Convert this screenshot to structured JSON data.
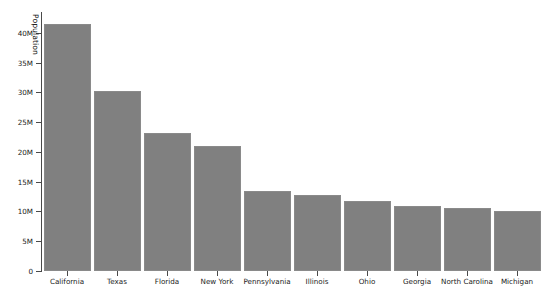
{
  "chart_data": {
    "type": "bar",
    "title": "",
    "xlabel": "",
    "ylabel": "Population",
    "categories": [
      "California",
      "Texas",
      "Florida",
      "New York",
      "Pennsylvania",
      "Illinois",
      "Ohio",
      "Georgia",
      "North Carolina",
      "Michigan"
    ],
    "values": [
      41.5,
      30.2,
      23.2,
      21.0,
      13.4,
      12.8,
      11.8,
      10.9,
      10.5,
      10.1
    ],
    "value_unit": "millions",
    "ylim": [
      0,
      43.5
    ],
    "ytick_values": [
      0,
      5,
      10,
      15,
      20,
      25,
      30,
      35,
      40
    ],
    "ytick_labels": [
      "0",
      "5M",
      "10M",
      "15M",
      "20M",
      "25M",
      "30M",
      "35M",
      "40M"
    ],
    "grid": false,
    "legend": false,
    "bar_color": "#808080",
    "bar_edge_color": "#8a8a8a",
    "axis_color": "#4a4a4a",
    "text_color": "#1a1a1a"
  }
}
